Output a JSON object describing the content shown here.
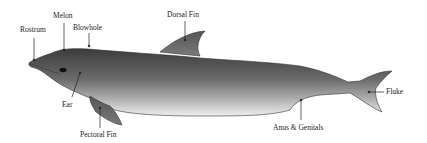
{
  "diagram": {
    "labels": {
      "rostrum": "Rostrum",
      "melon": "Melon",
      "blowhole": "Blowhole",
      "dorsal_fin": "Dorsal Fin",
      "ear": "Ear",
      "pectoral_fin": "Pectoral Fin",
      "anus_genitals": "Anus & Genitals",
      "fluke": "Fluke"
    }
  }
}
